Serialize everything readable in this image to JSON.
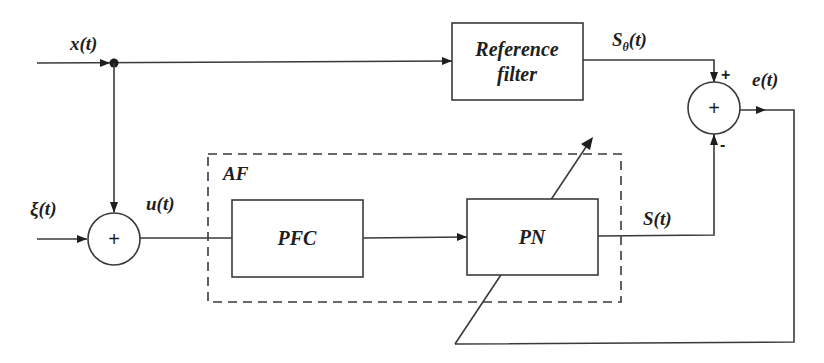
{
  "diagram": {
    "type": "block-diagram",
    "signals": {
      "input": "x(t)",
      "noise": "ξ(t)",
      "sum_out": "u(t)",
      "ref_out_main": "S",
      "ref_out_sub": "θ",
      "ref_out_tail": "(t)",
      "plant_out": "S(t)",
      "error": "e(t)"
    },
    "blocks": {
      "reference_filter_line1": "Reference",
      "reference_filter_line2": "filter",
      "pfc": "PFC",
      "pn": "PN",
      "adaptive_filter_group": "AF"
    },
    "summing_junctions": {
      "input_sum_sign": "+",
      "error_sum_sign": "+",
      "error_sum_plus_input": "+",
      "error_sum_minus_input": "-"
    },
    "colors": {
      "line": "#3a3a3a",
      "text": "#1e1e1e",
      "background": "#ffffff"
    }
  }
}
